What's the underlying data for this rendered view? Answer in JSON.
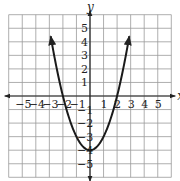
{
  "chart_data": {
    "type": "line",
    "title": "",
    "xlabel": "x",
    "ylabel": "y",
    "xlim": [
      -6,
      6
    ],
    "ylim": [
      -6,
      6
    ],
    "grid": true,
    "x_ticks": [
      -5,
      -4,
      -3,
      -2,
      -1,
      1,
      2,
      3,
      4,
      5
    ],
    "y_ticks": [
      -5,
      -4,
      -3,
      -2,
      -1,
      1,
      2,
      3,
      4,
      5
    ],
    "x_tick_labels": [
      "−5",
      "−4",
      "−3",
      "−2",
      "−1",
      "1",
      "2",
      "3",
      "4",
      "5"
    ],
    "y_tick_labels": [
      "−5",
      "−4",
      "−3",
      "−2",
      "−1",
      "1",
      "2",
      "3",
      "4",
      "5"
    ],
    "series": [
      {
        "name": "parabola",
        "equation": "y = x^2 - 4",
        "x": [
          -2.9,
          -2.5,
          -2,
          -1.5,
          -1,
          -0.5,
          0,
          0.5,
          1,
          1.5,
          2,
          2.5,
          2.9
        ],
        "values": [
          4.41,
          2.25,
          0,
          -1.75,
          -3,
          -3.75,
          -4,
          -3.75,
          -3,
          -1.75,
          0,
          2.25,
          4.41
        ],
        "arrows": "both ends",
        "color": "#1a1a1a"
      }
    ],
    "key_points": {
      "vertex": [
        0,
        -4
      ],
      "x_intercepts": [
        [
          -2,
          0
        ],
        [
          2,
          0
        ]
      ],
      "y_intercept": [
        0,
        -4
      ]
    }
  },
  "colors": {
    "grid": "#9a9a9a",
    "axes": "#222222",
    "curve": "#1a1a1a"
  }
}
